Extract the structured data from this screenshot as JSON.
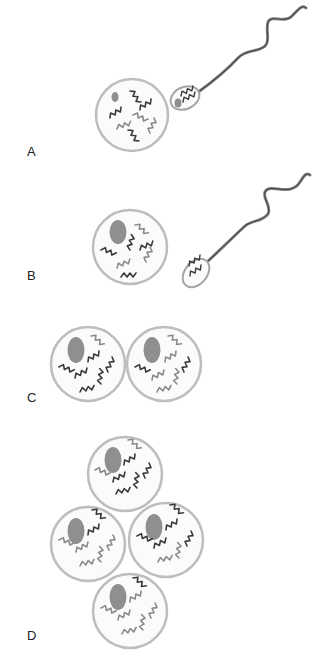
{
  "panels": [
    {
      "id": "A",
      "label": "A",
      "description": "Sperm contacting egg"
    },
    {
      "id": "B",
      "label": "B",
      "description": "Sperm nucleus within egg, sperm departing"
    },
    {
      "id": "C",
      "label": "C",
      "description": "Two-cell stage"
    },
    {
      "id": "D",
      "label": "D",
      "description": "Four-cell stage"
    }
  ],
  "colors": {
    "membrane": "#bdbdbd",
    "cell_fill": "#fafafa",
    "nucleus": "#8f8f8f",
    "chromosome_dark": "#3a3a3a",
    "chromosome_light": "#8a8a8a",
    "tail": "#555555",
    "label": "#222222"
  }
}
